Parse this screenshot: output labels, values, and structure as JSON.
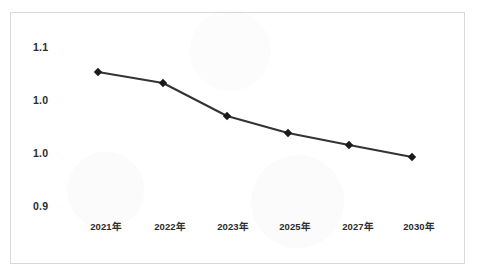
{
  "chart_data": {
    "type": "line",
    "title": "",
    "subtitle": "",
    "xlabel": "",
    "ylabel": "",
    "categories": [
      "2021年",
      "2022年",
      "2023年",
      "2025年",
      "2027年",
      "2030年"
    ],
    "series": [
      {
        "name": "",
        "values": [
          1.068,
          1.047,
          1.005,
          0.989,
          0.978,
          0.968
        ],
        "marker": "diamond",
        "color": "#333333"
      }
    ],
    "ytick_labels": [
      "1.1",
      "1.0",
      "1.0",
      "0.9"
    ],
    "ytick_values": [
      1.1,
      1.05,
      1.0,
      0.9
    ],
    "ylim": [
      0.9,
      1.1
    ],
    "grid": false,
    "legend": "none",
    "annotations": []
  },
  "axes": {
    "y_labels": [
      {
        "text": "1.1",
        "y_px": 48
      },
      {
        "text": "1.0",
        "y_px": 101
      },
      {
        "text": "1.0",
        "y_px": 154
      },
      {
        "text": "0.9",
        "y_px": 207
      }
    ],
    "x_labels": [
      {
        "text": "2021年",
        "x_px": 106
      },
      {
        "text": "2022年",
        "x_px": 170
      },
      {
        "text": "2023年",
        "x_px": 233
      },
      {
        "text": "2025年",
        "x_px": 295
      },
      {
        "text": "2027年",
        "x_px": 358
      },
      {
        "text": "2030年",
        "x_px": 419
      }
    ]
  },
  "points": [
    {
      "label": "2021年",
      "x_px": 98,
      "y_px": 72
    },
    {
      "label": "2022年",
      "x_px": 163,
      "y_px": 83
    },
    {
      "label": "2023年",
      "x_px": 227,
      "y_px": 116
    },
    {
      "label": "2025年",
      "x_px": 288,
      "y_px": 133
    },
    {
      "label": "2027年",
      "x_px": 349,
      "y_px": 145
    },
    {
      "label": "2030年",
      "x_px": 412,
      "y_px": 157
    }
  ],
  "style": {
    "line_color": "#333333",
    "marker_color": "#1a1a1a",
    "frame_color": "#d9d9d9",
    "text_color": "#2b2b2b",
    "background": "#ffffff"
  }
}
